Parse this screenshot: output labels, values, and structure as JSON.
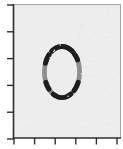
{
  "figure": {
    "width": 123,
    "height": 149,
    "outer_background": "#ffffff"
  },
  "chart_data": {
    "type": "heatmap",
    "title": "",
    "xlabel": "",
    "ylabel": "",
    "x_tick_labels": [],
    "y_tick_labels": [],
    "grid": false,
    "legend": false,
    "plot_area": {
      "x": 13.5,
      "y": 4,
      "width": 107,
      "height": 134,
      "background": "#ededed"
    },
    "frame": {
      "axis_color": "#2e2e2e",
      "axis_width": 1.6,
      "light_color": "#a6a6a6",
      "light_width": 1
    },
    "ticks": {
      "length": 6,
      "width": 1.4,
      "x_positions_px": [
        14,
        34.6,
        55.2,
        75.8,
        96.4,
        117
      ],
      "y_positions_px": [
        5,
        31.8,
        58.6,
        85.4,
        112.2,
        139
      ]
    },
    "glyph": {
      "label": "0",
      "cx": 62,
      "cy": 72,
      "rx": 17.6,
      "ry": 25.6,
      "stroke_width": 4.8,
      "base_color": "#8f8f8f",
      "dark_color": "#1e1e1e",
      "dark_segments_deg": [
        [
          55,
          125
        ],
        [
          28,
          46
        ],
        [
          138,
          160
        ],
        [
          204,
          222
        ],
        [
          240,
          300
        ],
        [
          314,
          336
        ]
      ]
    }
  }
}
